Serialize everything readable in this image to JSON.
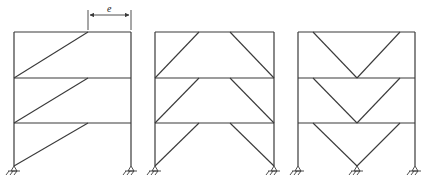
{
  "diagram": {
    "type": "structural-frames",
    "dimension_label": "e",
    "frames": [
      {
        "name": "eccentric-single-diagonal",
        "left_x": 14,
        "right_x": 131,
        "floors_y": [
          32,
          78,
          123,
          166
        ],
        "bracing": "single diagonal from lower-left to offset point on beam above",
        "diagonals": [
          [
            14,
            78,
            88,
            32
          ],
          [
            14,
            123,
            88,
            78
          ],
          [
            14,
            166,
            88,
            123
          ]
        ]
      },
      {
        "name": "eccentric-split-K",
        "left_x": 155,
        "right_x": 274,
        "floors_y": [
          32,
          78,
          123,
          166
        ],
        "bracing": "two diagonals from column bases to beam above with central link",
        "diagonals": [
          [
            155,
            78,
            199,
            32
          ],
          [
            274,
            78,
            230,
            32
          ],
          [
            155,
            123,
            199,
            78
          ],
          [
            274,
            123,
            230,
            78
          ],
          [
            155,
            166,
            199,
            123
          ],
          [
            274,
            166,
            230,
            123
          ]
        ]
      },
      {
        "name": "inverted-V-chevron",
        "left_x": 298,
        "right_x": 415,
        "floors_y": [
          32,
          78,
          123,
          166
        ],
        "bracing": "V-bracing meeting at mid-span of beam below",
        "diagonals": [
          [
            313,
            32,
            357,
            78
          ],
          [
            400,
            32,
            357,
            78
          ],
          [
            313,
            78,
            357,
            123
          ],
          [
            400,
            78,
            357,
            123
          ],
          [
            313,
            123,
            357,
            166
          ],
          [
            400,
            123,
            357,
            166
          ]
        ]
      }
    ],
    "supports": [
      {
        "x": 14,
        "y": 166
      },
      {
        "x": 131,
        "y": 166
      },
      {
        "x": 155,
        "y": 166
      },
      {
        "x": 274,
        "y": 166
      },
      {
        "x": 298,
        "y": 166
      },
      {
        "x": 357,
        "y": 166
      },
      {
        "x": 415,
        "y": 166
      }
    ]
  }
}
